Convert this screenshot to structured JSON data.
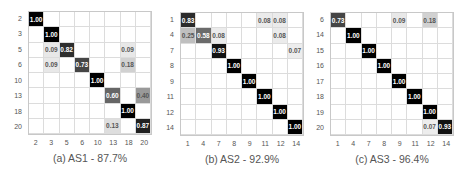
{
  "chart_data": [
    {
      "type": "heatmap",
      "title": "(a) AS1 - 87.7%",
      "row_labels": [
        "2",
        "3",
        "5",
        "6",
        "10",
        "13",
        "18",
        "20"
      ],
      "col_labels": [
        "2",
        "3",
        "5",
        "6",
        "10",
        "13",
        "18",
        "20"
      ],
      "values": [
        [
          1.0,
          0,
          0,
          0,
          0,
          0,
          0,
          0
        ],
        [
          0,
          1.0,
          0,
          0,
          0,
          0,
          0,
          0
        ],
        [
          0,
          0.09,
          0.82,
          0,
          0,
          0,
          0.09,
          0
        ],
        [
          0,
          0.09,
          0,
          0.73,
          0,
          0,
          0.18,
          0
        ],
        [
          0,
          0,
          0,
          0,
          1.0,
          0,
          0,
          0
        ],
        [
          0,
          0,
          0,
          0,
          0,
          0.6,
          0,
          0.4
        ],
        [
          0,
          0,
          0,
          0,
          0,
          0,
          1.0,
          0
        ],
        [
          0,
          0,
          0,
          0,
          0,
          0.13,
          0,
          0.87
        ]
      ]
    },
    {
      "type": "heatmap",
      "title": "(b) AS2 - 92.9%",
      "row_labels": [
        "1",
        "4",
        "7",
        "8",
        "9",
        "11",
        "12",
        "14"
      ],
      "col_labels": [
        "1",
        "4",
        "7",
        "8",
        "9",
        "11",
        "12",
        "14"
      ],
      "values": [
        [
          0.83,
          0,
          0,
          0,
          0,
          0.08,
          0.08,
          0
        ],
        [
          0.25,
          0.58,
          0.08,
          0,
          0,
          0,
          0.08,
          0
        ],
        [
          0,
          0,
          0.93,
          0,
          0,
          0,
          0,
          0.07
        ],
        [
          0,
          0,
          0,
          1.0,
          0,
          0,
          0,
          0
        ],
        [
          0,
          0,
          0,
          0,
          1.0,
          0,
          0,
          0
        ],
        [
          0,
          0,
          0,
          0,
          0,
          1.0,
          0,
          0
        ],
        [
          0,
          0,
          0,
          0,
          0,
          0,
          1.0,
          0
        ],
        [
          0,
          0,
          0,
          0,
          0,
          0,
          0,
          1.0
        ]
      ]
    },
    {
      "type": "heatmap",
      "title": "(c) AS3 - 96.4%",
      "row_labels": [
        "6",
        "14",
        "15",
        "16",
        "17",
        "18",
        "19",
        "20"
      ],
      "col_labels": [
        "1",
        "4",
        "7",
        "8",
        "9",
        "11",
        "12",
        "14"
      ],
      "values": [
        [
          0.73,
          0,
          0,
          0,
          0.09,
          0,
          0.18,
          0
        ],
        [
          0,
          1.0,
          0,
          0,
          0,
          0,
          0,
          0
        ],
        [
          0,
          0,
          1.0,
          0,
          0,
          0,
          0,
          0
        ],
        [
          0,
          0,
          0,
          1.0,
          0,
          0,
          0,
          0
        ],
        [
          0,
          0,
          0,
          0,
          1.0,
          0,
          0,
          0
        ],
        [
          0,
          0,
          0,
          0,
          0,
          1.0,
          0,
          0
        ],
        [
          0,
          0,
          0,
          0,
          0,
          0,
          1.0,
          0
        ],
        [
          0,
          0,
          0,
          0,
          0,
          0,
          0.07,
          0.93
        ]
      ]
    }
  ],
  "layout": {
    "panels": [
      {
        "grid_x": 28,
        "grid_y": 11,
        "cell": 15.5,
        "caption_x": 10
      },
      {
        "grid_x": 180,
        "grid_y": 12,
        "cell": 15.5,
        "caption_x": 162
      },
      {
        "grid_x": 330,
        "grid_y": 12,
        "cell": 15.5,
        "caption_x": 312
      }
    ]
  }
}
